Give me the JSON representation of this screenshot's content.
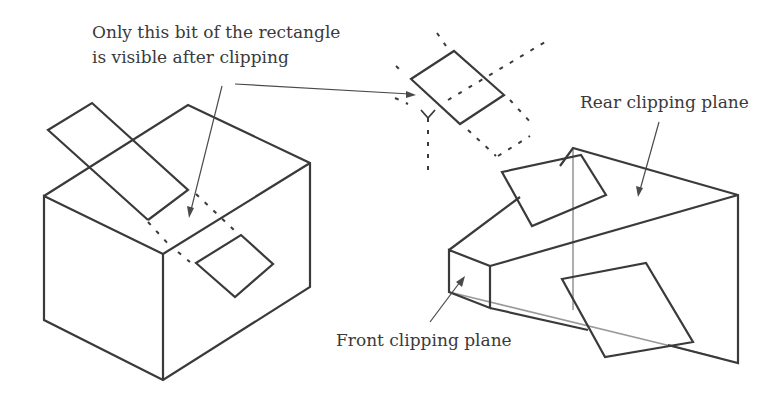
{
  "figure": {
    "labels": {
      "clip_note_line1": "Only this bit of the rectangle",
      "clip_note_line2": "is visible after clipping",
      "rear_plane": "Rear clipping plane",
      "front_plane": "Front clipping plane"
    },
    "parts": [
      {
        "name": "box-with-rectangle",
        "description": "Isometric box intersected by a rectangle"
      },
      {
        "name": "clipped-rectangle-detail",
        "description": "Rectangle with dashed clipped portions"
      },
      {
        "name": "view-frustum",
        "description": "Viewing frustum with front and rear clipping planes"
      }
    ],
    "colors": {
      "line": "#3a3a3a",
      "background": "#ffffff"
    }
  }
}
